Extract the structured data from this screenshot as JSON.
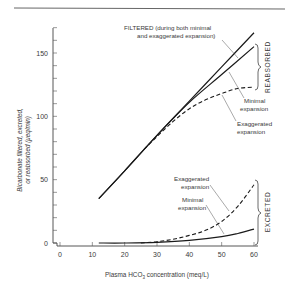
{
  "chart_data": {
    "type": "line",
    "title": "",
    "xlabel": "Plasma HCO3 concentration (meq/L)",
    "ylabel": "Bicarbonate filtered, excreted, or reabsorbed (μeq/min)",
    "xlim": [
      0,
      60
    ],
    "ylim": [
      0,
      170
    ],
    "x_ticks": [
      0,
      10,
      20,
      30,
      40,
      50,
      60
    ],
    "y_ticks": [
      0,
      50,
      100,
      150
    ],
    "grid": false,
    "legend": null,
    "series": [
      {
        "name": "Filtered (during both minimal and exaggerated expansion)",
        "style": "solid",
        "points": [
          [
            12,
            35
          ],
          [
            20,
            57
          ],
          [
            30,
            85
          ],
          [
            40,
            112
          ],
          [
            50,
            139
          ],
          [
            60,
            166
          ]
        ]
      },
      {
        "name": "Reabsorbed - Minimal expansion",
        "style": "solid",
        "points": [
          [
            12,
            35
          ],
          [
            20,
            57
          ],
          [
            30,
            85
          ],
          [
            40,
            111
          ],
          [
            50,
            133
          ],
          [
            60,
            155
          ]
        ]
      },
      {
        "name": "Reabsorbed - Exaggerated expansion",
        "style": "dashed",
        "points": [
          [
            26,
            74
          ],
          [
            30,
            84
          ],
          [
            35,
            96
          ],
          [
            40,
            106
          ],
          [
            45,
            113
          ],
          [
            50,
            118
          ],
          [
            55,
            122
          ],
          [
            60,
            123
          ]
        ]
      },
      {
        "name": "Excreted - Exaggerated expansion",
        "style": "dashed",
        "points": [
          [
            25,
            0
          ],
          [
            30,
            1
          ],
          [
            35,
            3
          ],
          [
            40,
            6
          ],
          [
            45,
            10
          ],
          [
            50,
            17
          ],
          [
            55,
            29
          ],
          [
            60,
            46
          ]
        ]
      },
      {
        "name": "Excreted - Minimal expansion",
        "style": "solid",
        "points": [
          [
            12,
            0
          ],
          [
            20,
            0
          ],
          [
            30,
            0.5
          ],
          [
            40,
            2
          ],
          [
            50,
            5
          ],
          [
            55,
            7.5
          ],
          [
            60,
            11
          ]
        ]
      }
    ],
    "annotations": [
      {
        "text": "FILTERED (during both minimal",
        "line2": "and exaggerated expansion)"
      },
      {
        "text": "Minimal",
        "line2": "expansion",
        "target": "Reabsorbed - Minimal expansion"
      },
      {
        "text": "Exaggerated",
        "line2": "expansion",
        "target": "Reabsorbed - Exaggerated expansion"
      },
      {
        "text": "Exaggerated",
        "line2": "expansion",
        "target": "Excreted - Exaggerated expansion"
      },
      {
        "text": "Minimal",
        "line2": "expansion",
        "target": "Excreted - Minimal expansion"
      }
    ],
    "brace_labels": [
      "REABSORBED",
      "EXCRETED"
    ]
  },
  "labels": {
    "filtered_1": "FILTERED (during both minimal",
    "filtered_2": "and exaggerated expansion)",
    "reab_min_1": "Minimal",
    "reab_min_2": "expansion",
    "reab_exag_1": "Exaggerated",
    "reab_exag_2": "expansion",
    "exc_exag_1": "Exaggerated",
    "exc_exag_2": "expansion",
    "exc_min_1": "Minimal",
    "exc_min_2": "expansion",
    "reabsorbed": "REABSORBED",
    "excreted": "EXCRETED",
    "ylabel_1": "Bicarbonate filtered, excreted,",
    "ylabel_2": "or reabsorbed (μeq/min)",
    "xlabel_main": "Plasma HCO",
    "xlabel_sub": "3",
    "xlabel_rest": " concentration (meq/L)"
  }
}
